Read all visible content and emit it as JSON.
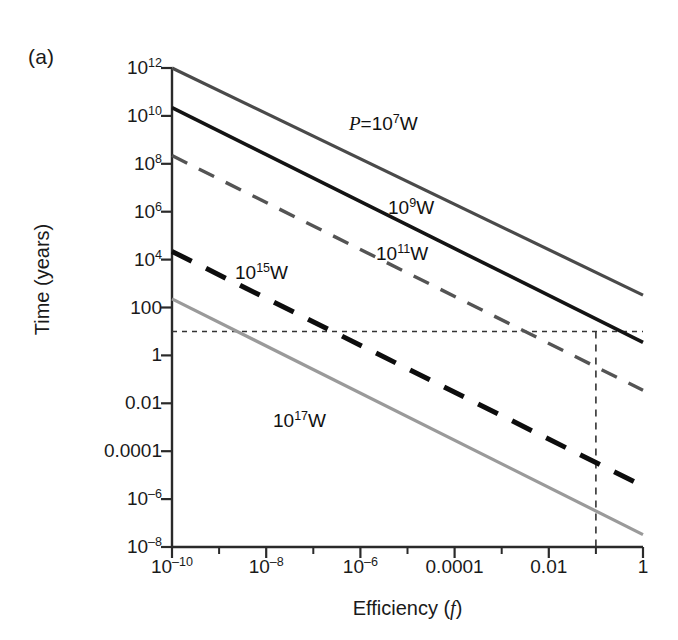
{
  "figure": {
    "panel_label": "(a)",
    "background": "#ffffff"
  },
  "chart_data": {
    "type": "line",
    "title": "",
    "subtitle": "",
    "xlabel": "Efficiency (f)",
    "ylabel": "Time (years)",
    "xscale": "log",
    "yscale": "log",
    "xlim": [
      1e-10,
      1
    ],
    "ylim": [
      1e-08,
      1000000000000.0
    ],
    "grid": false,
    "legend": "inline-labels",
    "xticks": [
      1e-10,
      1e-08,
      1e-06,
      0.0001,
      0.01,
      1
    ],
    "xticklabels": [
      "10⁻¹⁰",
      "10⁻⁸",
      "10⁻⁶",
      "0.0001",
      "0.01",
      "1"
    ],
    "yticks": [
      1e-08,
      1e-06,
      0.01,
      1,
      100,
      10000,
      1000000.0,
      100000000.0,
      10000000000.0,
      1000000000000.0
    ],
    "yticklabels": [
      "10⁻⁸",
      "10⁻⁶",
      "0.0001",
      "0.01",
      "1",
      "100",
      "10⁴",
      "10⁶",
      "10⁸",
      "10¹⁰",
      "10¹²"
    ],
    "series": [
      {
        "name": "P=10⁷W",
        "label": "P=10⁷W",
        "power_watts": 10000000.0,
        "color": "#4a4a4a",
        "style": "solid",
        "width": 3.2,
        "x": [
          1e-10,
          1
        ],
        "y": [
          1000000000000.0,
          330
        ]
      },
      {
        "name": "10⁹W",
        "label": "10⁹W",
        "power_watts": 1000000000.0,
        "color": "#141414",
        "style": "solid",
        "width": 3.6,
        "x": [
          1e-10,
          1
        ],
        "y": [
          22000000000.0,
          3.5
        ]
      },
      {
        "name": "10¹¹W",
        "label": "10¹¹W",
        "power_watts": 100000000000.0,
        "color": "#545454",
        "style": "dashed",
        "width": 3.4,
        "x": [
          1e-10,
          1
        ],
        "y": [
          220000000.0,
          0.035
        ]
      },
      {
        "name": "10¹⁵W",
        "label": "10¹⁵W",
        "power_watts": 1000000000000000.0,
        "color": "#0d0d0d",
        "style": "dashed-heavy",
        "width": 5.0,
        "x": [
          1e-10,
          1
        ],
        "y": [
          22000.0,
          3.5e-06
        ]
      },
      {
        "name": "10¹⁷W",
        "label": "10¹⁷W",
        "power_watts": 1e+17,
        "color": "#9a9a9a",
        "style": "solid",
        "width": 3.2,
        "x": [
          1e-10,
          1
        ],
        "y": [
          230,
          3.3e-08
        ]
      }
    ],
    "annotations": [
      {
        "name": "reference-horizontal",
        "type": "hline",
        "y": 10,
        "style": "dotted",
        "color": "#333333"
      },
      {
        "name": "reference-vertical",
        "type": "vline",
        "x": 0.1,
        "style": "dashed",
        "color": "#333333"
      }
    ]
  },
  "curve_labels": [
    {
      "key": "p7",
      "text": "P=10⁷W",
      "html": "<i>P</i>=10<sup>7</sup>W",
      "x": 349,
      "y": 113
    },
    {
      "key": "p9",
      "text": "10⁹W",
      "html": "10<sup>9</sup>W",
      "x": 388,
      "y": 197
    },
    {
      "key": "p11",
      "text": "10¹¹W",
      "html": "10<sup>11</sup>W",
      "x": 376,
      "y": 243
    },
    {
      "key": "p15",
      "text": "10¹⁵W",
      "html": "10<sup>15</sup>W",
      "x": 235,
      "y": 262
    },
    {
      "key": "p17",
      "text": "10¹⁷W",
      "html": "10<sup>17</sup>W",
      "x": 273,
      "y": 410
    }
  ],
  "axis": {
    "x_ticklabels_html": [
      "10<sup>–10</sup>",
      "10<sup>–8</sup>",
      "10<sup>–6</sup>",
      "0.0001",
      "0.01",
      "1"
    ],
    "y_ticklabels_html": [
      "10<sup>12</sup>",
      "10<sup>10</sup>",
      "10<sup>8</sup>",
      "10<sup>6</sup>",
      "10<sup>4</sup>",
      "100",
      "1",
      "0.01",
      "0.0001",
      "10<sup>–6</sup>",
      "10<sup>–8</sup>"
    ]
  }
}
